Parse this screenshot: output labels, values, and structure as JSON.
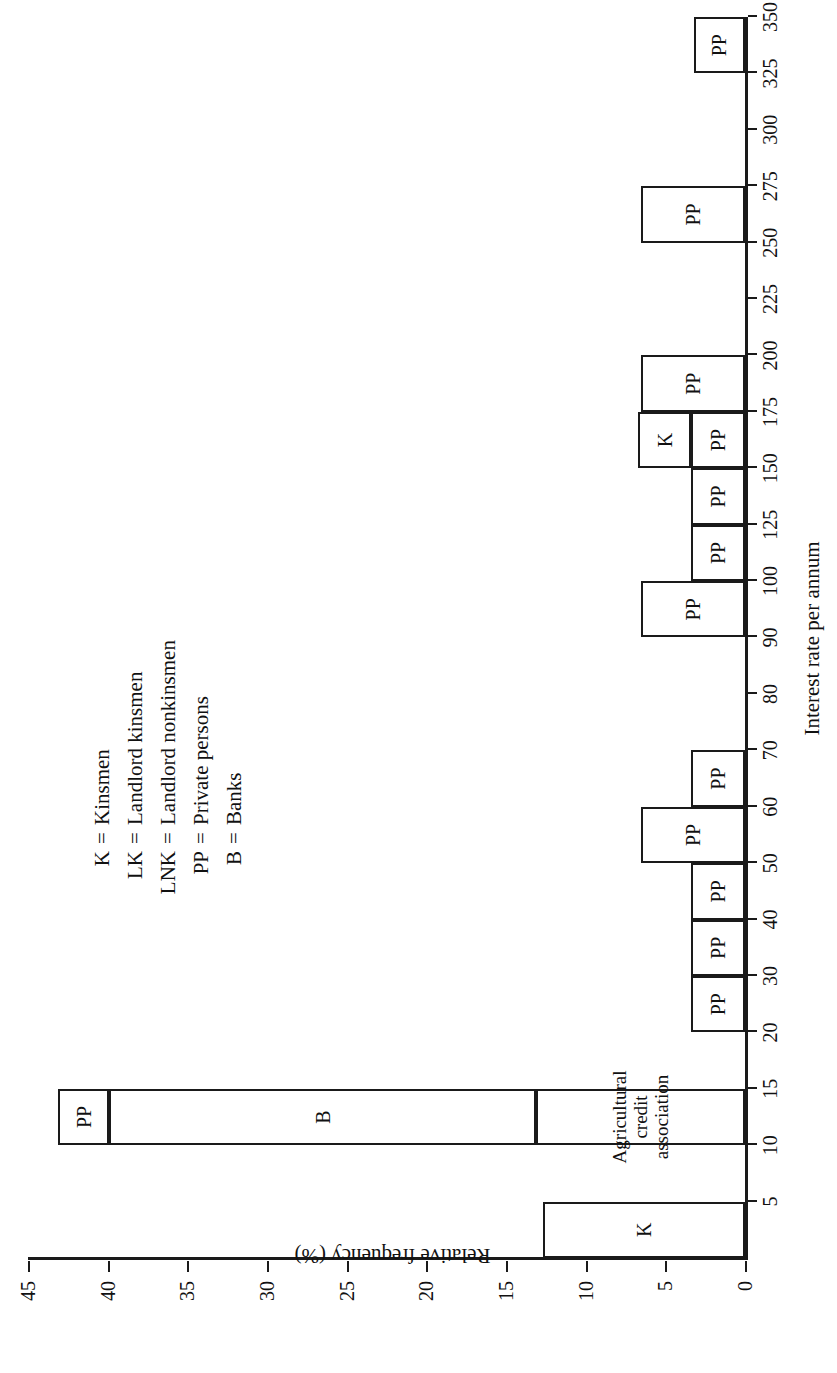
{
  "chart_data": {
    "type": "bar",
    "title": "",
    "orientation": "vertical-bars-rotated-page",
    "xlabel": "Interest rate per annum",
    "ylabel": "Relative frequency (%)",
    "xlim": [
      0,
      350
    ],
    "ylim": [
      0,
      45
    ],
    "grid": false,
    "legend_position": "upper-right",
    "x_tick_labels": [
      "5",
      "10",
      "15",
      "20",
      "30",
      "40",
      "50",
      "60",
      "70",
      "80",
      "90",
      "100",
      "125",
      "150",
      "175",
      "200",
      "225",
      "250",
      "275",
      "300",
      "325",
      "350"
    ],
    "x_tick_values": [
      5,
      10,
      15,
      20,
      30,
      40,
      50,
      60,
      70,
      80,
      90,
      100,
      125,
      150,
      175,
      200,
      225,
      250,
      275,
      300,
      325,
      350
    ],
    "y_tick_labels": [
      "0",
      "5",
      "10",
      "15",
      "20",
      "25",
      "30",
      "35",
      "40",
      "45"
    ],
    "y_tick_values": [
      0,
      5,
      10,
      15,
      20,
      25,
      30,
      35,
      40,
      45
    ],
    "bins": [
      {
        "name": "bin-0-5",
        "start": 0,
        "end": 5,
        "total": 12.7,
        "segments": [
          {
            "label": "K",
            "value": 12.7
          }
        ]
      },
      {
        "name": "bin-10-15",
        "start": 10,
        "end": 15,
        "total": 43.1,
        "segments": [
          {
            "label": "Agricultural credit association",
            "value": 13.1,
            "two_line": true
          },
          {
            "label": "B",
            "value": 26.8
          },
          {
            "label": "PP",
            "value": 3.2
          }
        ]
      },
      {
        "name": "bin-20-30",
        "start": 20,
        "end": 30,
        "total": 3.4,
        "segments": [
          {
            "label": "PP",
            "value": 3.4
          }
        ]
      },
      {
        "name": "bin-30-40",
        "start": 30,
        "end": 40,
        "total": 3.4,
        "segments": [
          {
            "label": "PP",
            "value": 3.4
          }
        ]
      },
      {
        "name": "bin-40-50",
        "start": 40,
        "end": 50,
        "total": 3.4,
        "segments": [
          {
            "label": "PP",
            "value": 3.4
          }
        ]
      },
      {
        "name": "bin-50-60",
        "start": 50,
        "end": 60,
        "total": 6.5,
        "segments": [
          {
            "label": "PP",
            "value": 6.5
          }
        ]
      },
      {
        "name": "bin-60-70",
        "start": 60,
        "end": 70,
        "total": 3.4,
        "segments": [
          {
            "label": "PP",
            "value": 3.4
          }
        ]
      },
      {
        "name": "bin-90-100",
        "start": 90,
        "end": 100,
        "total": 6.5,
        "segments": [
          {
            "label": "PP",
            "value": 6.5
          }
        ]
      },
      {
        "name": "bin-100-125",
        "start": 100,
        "end": 125,
        "total": 3.4,
        "segments": [
          {
            "label": "PP",
            "value": 3.4
          }
        ]
      },
      {
        "name": "bin-125-150",
        "start": 125,
        "end": 150,
        "total": 3.4,
        "segments": [
          {
            "label": "PP",
            "value": 3.4
          }
        ]
      },
      {
        "name": "bin-150-175",
        "start": 150,
        "end": 175,
        "total": 6.7,
        "segments": [
          {
            "label": "PP",
            "value": 3.4
          },
          {
            "label": "K",
            "value": 3.3
          }
        ]
      },
      {
        "name": "bin-175-200",
        "start": 175,
        "end": 200,
        "total": 6.5,
        "segments": [
          {
            "label": "PP",
            "value": 6.5
          }
        ]
      },
      {
        "name": "bin-250-275",
        "start": 250,
        "end": 275,
        "total": 6.5,
        "segments": [
          {
            "label": "PP",
            "value": 6.5
          }
        ]
      },
      {
        "name": "bin-325-350",
        "start": 325,
        "end": 350,
        "total": 3.2,
        "segments": [
          {
            "label": "PP",
            "value": 3.2
          }
        ]
      }
    ],
    "legend": [
      {
        "key": "K",
        "eq": "=",
        "desc": "Kinsmen"
      },
      {
        "key": "LK",
        "eq": "=",
        "desc": "Landlord kinsmen"
      },
      {
        "key": "LNK",
        "eq": "=",
        "desc": "Landlord nonkinsmen"
      },
      {
        "key": "PP",
        "eq": "=",
        "desc": "Private persons"
      },
      {
        "key": "B",
        "eq": "=",
        "desc": "Banks"
      }
    ],
    "colors": {
      "ink": "#1a1a1a",
      "bar_fill": "#ffffff",
      "background": "#ffffff"
    }
  }
}
